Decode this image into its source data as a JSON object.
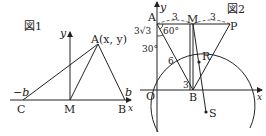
{
  "figure1": {
    "title": "図1",
    "axis_x_label": "x",
    "axis_y_label": "y",
    "point_A_label": "A(x, y)",
    "point_C_label": "C",
    "point_M_label": "M",
    "point_B_label": "B",
    "neg_b_label": "−b",
    "b_label": "b"
  },
  "figure2": {
    "title": "図2",
    "axis_x_label": "x",
    "axis_y_label": "y",
    "point_A_label": "A",
    "point_M_label": "M",
    "point_P_label": "P",
    "point_B_label": "B",
    "point_R_label": "R",
    "point_S_label": "S",
    "origin_label": "O",
    "seg_AM_label": "3",
    "seg_MP_label": "3",
    "seg_AO_label": "3√3",
    "seg_AB_label": "6",
    "seg_OB_label": "3",
    "angle_60_label": "60°",
    "angle_30_label": "30°"
  },
  "colors": {
    "stroke": "#222222",
    "background": "#ffffff"
  }
}
